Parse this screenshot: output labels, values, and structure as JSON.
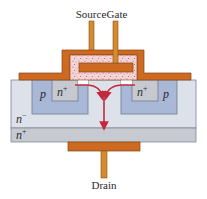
{
  "diagram": {
    "type": "device-cross-section",
    "terminals": {
      "source": "Source",
      "gate": "Gate",
      "drain": "Drain"
    },
    "regions": {
      "p_left": "p",
      "p_right": "p",
      "nplus_left": "n",
      "nplus_right": "n",
      "nplus_sup": "+",
      "nminus": "n",
      "nminus_sup": "−",
      "substrate": "n",
      "substrate_sup": "+"
    },
    "colors": {
      "metal": "#cc6a22",
      "metal_edge": "#8a4410",
      "oxide": "#f3d6da",
      "oxide_speckle": "#c7505e",
      "p_well": "#a9b8d6",
      "n_source": "#c6c9cf",
      "n_drift": "#dde2ea",
      "n_substrate": "#c7cbd1",
      "channel": "#ffffff",
      "current_arrow": "#c22a3c",
      "outline": "#7f8794"
    },
    "flow": {
      "description": "Electrons flow from n+ source regions through channels under the gate, converge and flow down through n- drift and n+ substrate to drain"
    }
  }
}
